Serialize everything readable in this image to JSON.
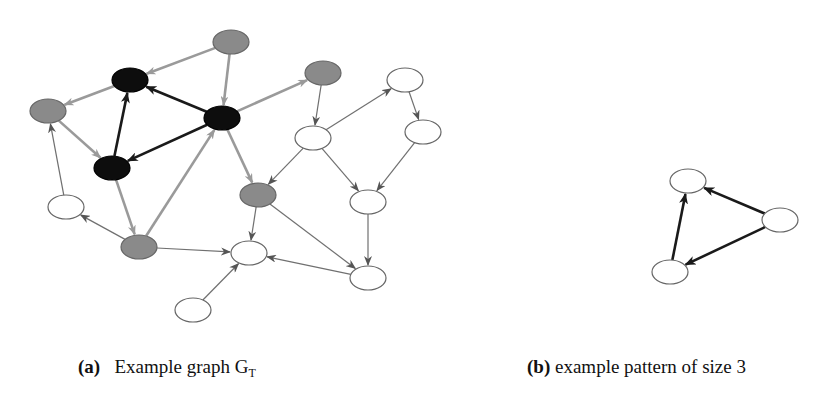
{
  "colors": {
    "black_node": "#0d0d0d",
    "gray_node": "#8a8a8a",
    "white_node": "#ffffff",
    "node_stroke": "#666666",
    "gray_edge": "#9a9a9a",
    "thin_edge": "#707070",
    "black_edge": "#1a1a1a"
  },
  "graph_a": {
    "nodes": [
      {
        "id": "g1",
        "x": 231,
        "y": 42,
        "fill": "gray"
      },
      {
        "id": "b1",
        "x": 130,
        "y": 80,
        "fill": "black"
      },
      {
        "id": "g2",
        "x": 48,
        "y": 111,
        "fill": "gray"
      },
      {
        "id": "b2",
        "x": 222,
        "y": 118,
        "fill": "black"
      },
      {
        "id": "b3",
        "x": 112,
        "y": 168,
        "fill": "black"
      },
      {
        "id": "g3",
        "x": 323,
        "y": 73,
        "fill": "gray"
      },
      {
        "id": "w1",
        "x": 313,
        "y": 138,
        "fill": "white"
      },
      {
        "id": "w2",
        "x": 405,
        "y": 80,
        "fill": "white"
      },
      {
        "id": "w3",
        "x": 423,
        "y": 132,
        "fill": "white"
      },
      {
        "id": "w4",
        "x": 368,
        "y": 202,
        "fill": "white"
      },
      {
        "id": "g5",
        "x": 258,
        "y": 195,
        "fill": "gray"
      },
      {
        "id": "wl",
        "x": 66,
        "y": 207,
        "fill": "white"
      },
      {
        "id": "g4",
        "x": 139,
        "y": 247,
        "fill": "gray"
      },
      {
        "id": "wc",
        "x": 249,
        "y": 253,
        "fill": "white"
      },
      {
        "id": "w5",
        "x": 368,
        "y": 278,
        "fill": "white"
      },
      {
        "id": "wb",
        "x": 193,
        "y": 310,
        "fill": "white"
      }
    ],
    "edges": [
      {
        "from": "g1",
        "to": "b1",
        "style": "gray"
      },
      {
        "from": "g1",
        "to": "b2",
        "style": "gray"
      },
      {
        "from": "b1",
        "to": "g2",
        "style": "gray"
      },
      {
        "from": "b2",
        "to": "b1",
        "style": "black"
      },
      {
        "from": "b3",
        "to": "b1",
        "style": "black"
      },
      {
        "from": "b2",
        "to": "b3",
        "style": "black"
      },
      {
        "from": "g2",
        "to": "b3",
        "style": "gray"
      },
      {
        "from": "b2",
        "to": "g3",
        "style": "gray"
      },
      {
        "from": "b2",
        "to": "g5",
        "style": "gray"
      },
      {
        "from": "b3",
        "to": "g4",
        "style": "gray"
      },
      {
        "from": "g4",
        "to": "b2",
        "style": "gray"
      },
      {
        "from": "wl",
        "to": "g2",
        "style": "thin"
      },
      {
        "from": "g4",
        "to": "wl",
        "style": "thin"
      },
      {
        "from": "g4",
        "to": "wc",
        "style": "thin"
      },
      {
        "from": "g3",
        "to": "w1",
        "style": "thin"
      },
      {
        "from": "w1",
        "to": "w2",
        "style": "thin"
      },
      {
        "from": "w2",
        "to": "w3",
        "style": "thin"
      },
      {
        "from": "w1",
        "to": "g5",
        "style": "thin"
      },
      {
        "from": "w1",
        "to": "w4",
        "style": "thin"
      },
      {
        "from": "w3",
        "to": "w4",
        "style": "thin"
      },
      {
        "from": "w4",
        "to": "w5",
        "style": "thin"
      },
      {
        "from": "g5",
        "to": "wc",
        "style": "thin"
      },
      {
        "from": "g5",
        "to": "w5",
        "style": "thin"
      },
      {
        "from": "w5",
        "to": "wc",
        "style": "thin"
      },
      {
        "from": "wb",
        "to": "wc",
        "style": "thin"
      }
    ]
  },
  "graph_b": {
    "nodes": [
      {
        "id": "p1",
        "x": 688,
        "y": 181,
        "fill": "white"
      },
      {
        "id": "p2",
        "x": 780,
        "y": 220,
        "fill": "white"
      },
      {
        "id": "p3",
        "x": 670,
        "y": 272,
        "fill": "white"
      }
    ],
    "edges": [
      {
        "from": "p2",
        "to": "p1",
        "style": "black"
      },
      {
        "from": "p2",
        "to": "p3",
        "style": "black"
      },
      {
        "from": "p3",
        "to": "p1",
        "style": "black"
      }
    ]
  },
  "captions": {
    "a": {
      "label": "(a)",
      "text": "Example graph G",
      "subscript": "T"
    },
    "b": {
      "label": "(b)",
      "text": " example pattern of size 3"
    }
  }
}
